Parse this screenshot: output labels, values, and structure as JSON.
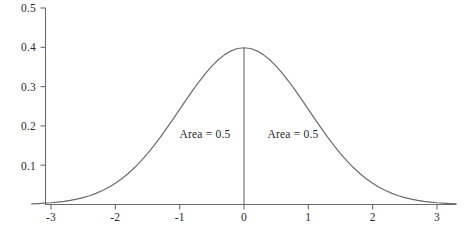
{
  "chart_data": {
    "type": "line",
    "title": "",
    "subtitle": "",
    "xlabel": "",
    "ylabel": "",
    "xlim": [
      -3.3,
      3.3
    ],
    "ylim": [
      0,
      0.5
    ],
    "grid": false,
    "legend": null,
    "curve_color": "#6b6b6b",
    "axis_color": "#6b6b6b",
    "text_color": "#2b2b2b",
    "xticks": [
      -3,
      -2,
      -1,
      0,
      1,
      2,
      3
    ],
    "xtick_labels": [
      "-3",
      "-2",
      "-1",
      "0",
      "1",
      "2",
      "3"
    ],
    "yticks": [
      0.1,
      0.2,
      0.3,
      0.4,
      0.5
    ],
    "ytick_labels": [
      "0.1",
      "0.2",
      "0.3",
      "0.4",
      "0.5"
    ],
    "series": [
      {
        "name": "standard-normal-pdf",
        "formula": "(1/sqrt(2*pi))*exp(-x^2/2)",
        "x": [
          -3.3,
          -3.2,
          -3.1,
          -3.0,
          -2.9,
          -2.8,
          -2.7,
          -2.6,
          -2.5,
          -2.4,
          -2.3,
          -2.2,
          -2.1,
          -2.0,
          -1.9,
          -1.8,
          -1.7,
          -1.6,
          -1.5,
          -1.4,
          -1.3,
          -1.2,
          -1.1,
          -1.0,
          -0.9,
          -0.8,
          -0.7,
          -0.6,
          -0.5,
          -0.4,
          -0.3,
          -0.2,
          -0.1,
          0.0,
          0.1,
          0.2,
          0.3,
          0.4,
          0.5,
          0.6,
          0.7,
          0.8,
          0.9,
          1.0,
          1.1,
          1.2,
          1.3,
          1.4,
          1.5,
          1.6,
          1.7,
          1.8,
          1.9,
          2.0,
          2.1,
          2.2,
          2.3,
          2.4,
          2.5,
          2.6,
          2.7,
          2.8,
          2.9,
          3.0,
          3.1,
          3.2,
          3.3
        ],
        "y": [
          0.0017,
          0.0024,
          0.0033,
          0.0044,
          0.006,
          0.0079,
          0.0104,
          0.0136,
          0.0175,
          0.0224,
          0.0283,
          0.0355,
          0.044,
          0.054,
          0.0656,
          0.079,
          0.094,
          0.1109,
          0.1295,
          0.1497,
          0.1714,
          0.1942,
          0.2179,
          0.242,
          0.2661,
          0.2897,
          0.3123,
          0.3332,
          0.3521,
          0.3683,
          0.3814,
          0.391,
          0.397,
          0.3989,
          0.397,
          0.391,
          0.3814,
          0.3683,
          0.3521,
          0.3332,
          0.3123,
          0.2897,
          0.2661,
          0.242,
          0.2179,
          0.1942,
          0.1714,
          0.1497,
          0.1295,
          0.1109,
          0.094,
          0.079,
          0.0656,
          0.054,
          0.044,
          0.0355,
          0.0283,
          0.0224,
          0.0175,
          0.0136,
          0.0104,
          0.0079,
          0.006,
          0.0044,
          0.0033,
          0.0024,
          0.0017
        ]
      }
    ],
    "vertical_line": {
      "name": "mean-line",
      "x": 0,
      "y_from": 0,
      "y_to": 0.3989
    },
    "annotations": [
      {
        "name": "left-area-label",
        "text": "Area = 0.5",
        "x": -0.6,
        "y": 0.18
      },
      {
        "name": "right-area-label",
        "text": "Area = 0.5",
        "x": 0.75,
        "y": 0.18
      }
    ]
  },
  "axis": {
    "ytick_0": "0.1",
    "ytick_1": "0.2",
    "ytick_2": "0.3",
    "ytick_3": "0.4",
    "ytick_4": "0.5",
    "xtick_0": "-3",
    "xtick_1": "-2",
    "xtick_2": "-1",
    "xtick_3": "0",
    "xtick_4": "1",
    "xtick_5": "2",
    "xtick_6": "3"
  },
  "labels": {
    "left_area": "Area = 0.5",
    "right_area": "Area = 0.5"
  }
}
